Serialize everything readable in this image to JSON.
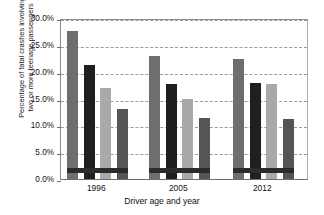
{
  "chart_data": {
    "type": "bar",
    "title": "",
    "xlabel": "Driver age and year",
    "ylabel": "Percentage of fatal crashes involving two or more teenage passengers",
    "ylabel_line1": "Percentage of fatal crashes involving",
    "ylabel_line2": "two or more teenage passengers",
    "categories": [
      "1996",
      "2005",
      "2012"
    ],
    "ylim": [
      0,
      30
    ],
    "ytick_values": [
      0,
      5,
      10,
      15,
      20,
      25,
      30
    ],
    "ytick_labels": [
      "0.0%",
      "5.0%",
      "10.0%",
      "15.0%",
      "20.0%",
      "25.0%",
      "30.0%"
    ],
    "grid": true,
    "grid_style": "dashed-horizontal",
    "legend": "none",
    "series": [
      {
        "name": "series-1",
        "color": "#6e6e6e",
        "values": [
          27.6,
          22.9,
          22.4
        ]
      },
      {
        "name": "series-2",
        "color": "#1f1f1f",
        "values": [
          21.2,
          17.7,
          17.8
        ]
      },
      {
        "name": "series-3",
        "color": "#a9a9a9",
        "values": [
          16.9,
          14.9,
          17.7
        ]
      },
      {
        "name": "series-4",
        "color": "#555555",
        "values": [
          13.1,
          11.4,
          11.1
        ]
      }
    ],
    "overlay_band": {
      "name": "dark-horizontal-band",
      "color": "#2b2b2b",
      "y_low": 1.5,
      "y_high": 2.4
    }
  }
}
